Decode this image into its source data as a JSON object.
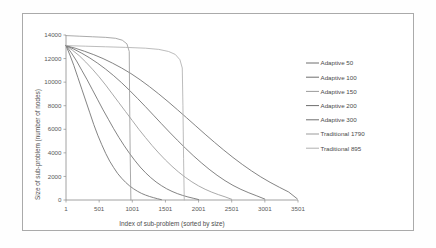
{
  "chart_data": {
    "type": "line",
    "title": "",
    "xlabel": "Index of sub-problem (sorted by size)",
    "ylabel": "Size of sub-problem (number of nodes)",
    "xlim": [
      1,
      3501
    ],
    "ylim": [
      0,
      14000
    ],
    "xticks": [
      1,
      501,
      1001,
      1501,
      2001,
      2501,
      3001,
      3501
    ],
    "xtick_labels": [
      "1",
      "501",
      "1001",
      "1501",
      "2001",
      "2501",
      "3001",
      "3501"
    ],
    "yticks": [
      0,
      2000,
      4000,
      6000,
      8000,
      10000,
      12000,
      14000
    ],
    "ytick_labels": [
      "0",
      "2000",
      "4000",
      "6000",
      "8000",
      "10000",
      "12000",
      "14000"
    ],
    "grid": false,
    "legend_position": "right",
    "series": [
      {
        "name": "Adaptive 50",
        "color": "#6e6e6e",
        "x": [
          1,
          60,
          120,
          180,
          240,
          300,
          360,
          420,
          480,
          540,
          600,
          660,
          720,
          780,
          840,
          900,
          960,
          1020,
          1080,
          1140,
          1200,
          1260,
          1320,
          1380,
          1440
        ],
        "y": [
          13100,
          12300,
          11400,
          10400,
          9400,
          8400,
          7400,
          6400,
          5500,
          4700,
          3950,
          3300,
          2750,
          2250,
          1850,
          1500,
          1200,
          950,
          740,
          560,
          420,
          300,
          200,
          110,
          30
        ]
      },
      {
        "name": "Adaptive 100",
        "color": "#6e6e6e",
        "x": [
          1,
          80,
          160,
          240,
          320,
          400,
          480,
          560,
          640,
          720,
          800,
          880,
          960,
          1040,
          1120,
          1200,
          1280,
          1360,
          1440,
          1520,
          1600,
          1680,
          1760,
          1840,
          1920,
          2000
        ],
        "y": [
          13100,
          12500,
          11800,
          11000,
          10200,
          9350,
          8500,
          7650,
          6850,
          6050,
          5300,
          4600,
          3950,
          3350,
          2800,
          2320,
          1900,
          1530,
          1220,
          950,
          730,
          545,
          390,
          260,
          150,
          40
        ]
      },
      {
        "name": "Adaptive 150",
        "color": "#9b9b9b",
        "x": [
          1,
          100,
          200,
          300,
          400,
          500,
          600,
          700,
          800,
          900,
          1000,
          1100,
          1200,
          1300,
          1400,
          1500,
          1600,
          1700,
          1800,
          1900,
          2000,
          2100,
          2200,
          2300,
          2400,
          2500
        ],
        "y": [
          13100,
          12700,
          12250,
          11700,
          11100,
          10450,
          9750,
          9000,
          8250,
          7500,
          6750,
          6000,
          5300,
          4620,
          3990,
          3400,
          2860,
          2370,
          1930,
          1540,
          1200,
          910,
          665,
          455,
          270,
          60
        ]
      },
      {
        "name": "Adaptive 200",
        "color": "#6e6e6e",
        "x": [
          1,
          120,
          240,
          360,
          480,
          600,
          720,
          840,
          960,
          1080,
          1200,
          1320,
          1440,
          1560,
          1680,
          1800,
          1920,
          2040,
          2160,
          2280,
          2400,
          2520,
          2640,
          2760,
          2880,
          3000
        ],
        "y": [
          13100,
          12800,
          12450,
          12050,
          11600,
          11100,
          10550,
          9950,
          9300,
          8620,
          7920,
          7200,
          6480,
          5770,
          5080,
          4410,
          3770,
          3170,
          2610,
          2100,
          1640,
          1240,
          900,
          610,
          350,
          80
        ]
      },
      {
        "name": "Adaptive 300",
        "color": "#6e6e6e",
        "x": [
          1,
          140,
          280,
          420,
          560,
          700,
          840,
          980,
          1120,
          1260,
          1400,
          1540,
          1680,
          1820,
          1960,
          2100,
          2240,
          2380,
          2520,
          2660,
          2800,
          2940,
          3080,
          3220,
          3360,
          3490
        ],
        "y": [
          13100,
          12880,
          12620,
          12330,
          12000,
          11620,
          11200,
          10730,
          10200,
          9620,
          9000,
          8350,
          7670,
          6980,
          6280,
          5580,
          4900,
          4240,
          3610,
          3020,
          2470,
          1960,
          1500,
          1080,
          680,
          100
        ]
      },
      {
        "name": "Traditional 1790",
        "color": "#9b9b9b",
        "x": [
          1,
          200,
          400,
          600,
          750,
          850,
          920,
          955,
          960,
          970,
          980
        ],
        "y": [
          13950,
          13900,
          13850,
          13800,
          13720,
          13560,
          13250,
          12600,
          9000,
          3500,
          0
        ]
      },
      {
        "name": "Traditional 895",
        "color": "#b0b0b0",
        "x": [
          1,
          300,
          600,
          900,
          1200,
          1400,
          1550,
          1650,
          1720,
          1755,
          1765,
          1775,
          1785
        ],
        "y": [
          13100,
          13050,
          13000,
          12950,
          12880,
          12780,
          12600,
          12350,
          11900,
          11200,
          8000,
          3500,
          0
        ]
      }
    ]
  },
  "legend": {
    "items": [
      {
        "label": "Adaptive 50"
      },
      {
        "label": "Adaptive 100"
      },
      {
        "label": "Adaptive 150"
      },
      {
        "label": "Adaptive 200"
      },
      {
        "label": "Adaptive 300"
      },
      {
        "label": "Traditional 1790"
      },
      {
        "label": "Traditional 895"
      }
    ]
  }
}
